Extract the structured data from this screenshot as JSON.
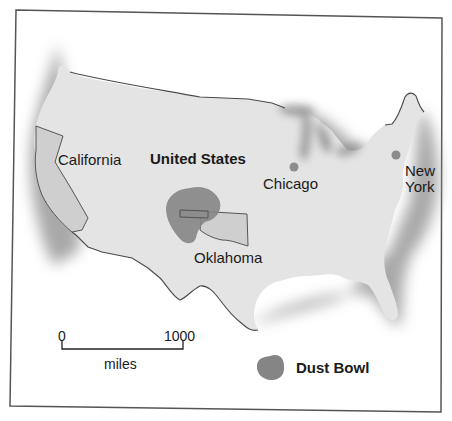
{
  "map": {
    "title": "United States",
    "colors": {
      "land": "#e4e4e4",
      "state_fill": "#cfcfcf",
      "dust_bowl": "#858585",
      "city_dot": "#8c8c8c",
      "border": "#4a4a4a",
      "shadow": "#9a9a9a",
      "frame": "#555555"
    },
    "labels": {
      "country": "United States",
      "california": "California",
      "oklahoma": "Oklahoma",
      "chicago": "Chicago",
      "new_york_line1": "New",
      "new_york_line2": "York"
    },
    "cities": [
      {
        "name": "Chicago",
        "x": 294,
        "y": 167
      },
      {
        "name": "New York",
        "x": 396,
        "y": 155
      }
    ],
    "scale_bar": {
      "start_label": "0",
      "end_label": "1000",
      "unit_label": "miles"
    },
    "legend": {
      "dust_bowl_label": "Dust Bowl"
    }
  }
}
